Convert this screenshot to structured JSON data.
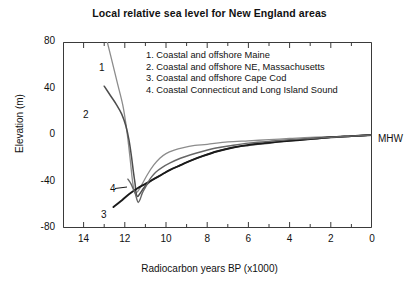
{
  "title": "Local relative sea level for New England areas",
  "axes": {
    "xlabel": "Radiocarbon years BP (x1000)",
    "ylabel": "Elevation (m)",
    "x_ticks": [
      "14",
      "12",
      "10",
      "8",
      "6",
      "4",
      "2",
      "0"
    ],
    "y_ticks": [
      "80",
      "40",
      "0",
      "-40",
      "-80"
    ]
  },
  "annotations": {
    "mhw": "MHW",
    "curve_label_1": "1",
    "curve_label_2": "2",
    "curve_label_3": "3",
    "curve_label_4": "4"
  },
  "legend": {
    "items": [
      "1. Coastal and offshore Maine",
      "2. Coastal and offshore NE, Massachusetts",
      "3. Coastal and offshore Cape Cod",
      "4. Coastal Connecticut and Long Island Sound"
    ]
  },
  "colors": {
    "curve1": "#8c8c8c",
    "curve2": "#4d4d4d",
    "curve3": "#1a1a1a",
    "curve4": "#666666",
    "axis": "#3a3a3a",
    "text": "#111111"
  },
  "chart_data": {
    "type": "line",
    "title": "Local relative sea level for New England areas",
    "xlabel": "Radiocarbon years BP (x1000)",
    "ylabel": "Elevation (m)",
    "xlim": [
      15.0,
      0.0
    ],
    "ylim": [
      -80,
      80
    ],
    "x_reversed": true,
    "grid": false,
    "legend_position": "inside-top-right",
    "x_major_ticks": [
      14,
      12,
      10,
      8,
      6,
      4,
      2,
      0
    ],
    "x_minor_ticks": [
      15,
      13,
      11,
      9,
      7,
      5,
      3,
      1
    ],
    "y_major_ticks": [
      80,
      40,
      0,
      -40,
      -80
    ],
    "y_minor_ticks": [
      70,
      60,
      50,
      30,
      20,
      10,
      -10,
      -20,
      -30,
      -50,
      -60,
      -70
    ],
    "reference_line": {
      "label": "MHW",
      "y": 0
    },
    "series": [
      {
        "name": "1. Coastal and offshore Maine",
        "label": "1",
        "color": "#8c8c8c",
        "points": [
          [
            12.85,
            80
          ],
          [
            12.6,
            62
          ],
          [
            12.35,
            44
          ],
          [
            12.1,
            26
          ],
          [
            11.95,
            10
          ],
          [
            11.82,
            -8
          ],
          [
            11.72,
            -24
          ],
          [
            11.65,
            -36
          ],
          [
            11.58,
            -45
          ],
          [
            11.5,
            -50
          ],
          [
            11.35,
            -48
          ],
          [
            11.15,
            -42
          ],
          [
            10.9,
            -34
          ],
          [
            10.6,
            -26
          ],
          [
            10.3,
            -20
          ],
          [
            10.0,
            -16
          ],
          [
            9.6,
            -13
          ],
          [
            9.2,
            -11
          ],
          [
            8.6,
            -9
          ],
          [
            8.0,
            -8
          ],
          [
            7.0,
            -6
          ],
          [
            6.0,
            -5
          ],
          [
            5.0,
            -4
          ],
          [
            4.0,
            -3
          ],
          [
            3.0,
            -2
          ],
          [
            2.0,
            -1.5
          ],
          [
            1.0,
            -1
          ],
          [
            0.0,
            0
          ]
        ]
      },
      {
        "name": "2. Coastal and offshore NE, Massachusetts",
        "label": "2",
        "color": "#4d4d4d",
        "points": [
          [
            13.0,
            42
          ],
          [
            12.7,
            34
          ],
          [
            12.4,
            26
          ],
          [
            12.15,
            18
          ],
          [
            11.95,
            8
          ],
          [
            11.8,
            -4
          ],
          [
            11.68,
            -18
          ],
          [
            11.58,
            -32
          ],
          [
            11.5,
            -42
          ],
          [
            11.45,
            -50
          ],
          [
            11.38,
            -53
          ],
          [
            11.25,
            -50
          ],
          [
            11.1,
            -46
          ],
          [
            10.9,
            -42
          ],
          [
            10.6,
            -38
          ],
          [
            10.2,
            -34
          ],
          [
            9.8,
            -30
          ],
          [
            9.3,
            -26
          ],
          [
            8.8,
            -22
          ],
          [
            8.2,
            -18
          ],
          [
            7.5,
            -14
          ],
          [
            6.8,
            -11
          ],
          [
            6.0,
            -9
          ],
          [
            5.0,
            -7
          ],
          [
            4.0,
            -5
          ],
          [
            3.0,
            -3.5
          ],
          [
            2.0,
            -2
          ],
          [
            1.0,
            -1
          ],
          [
            0.0,
            0
          ]
        ]
      },
      {
        "name": "3. Coastal and offshore Cape Cod",
        "label": "3",
        "color": "#1a1a1a",
        "points": [
          [
            12.55,
            -62
          ],
          [
            12.2,
            -57
          ],
          [
            11.8,
            -51
          ],
          [
            11.4,
            -46
          ],
          [
            11.0,
            -42
          ],
          [
            10.6,
            -38
          ],
          [
            10.2,
            -34
          ],
          [
            9.8,
            -30
          ],
          [
            9.3,
            -26
          ],
          [
            8.8,
            -22
          ],
          [
            8.2,
            -18
          ],
          [
            7.5,
            -14
          ],
          [
            6.8,
            -11
          ],
          [
            6.0,
            -8.5
          ],
          [
            5.0,
            -6.5
          ],
          [
            4.0,
            -5
          ],
          [
            3.0,
            -3.5
          ],
          [
            2.0,
            -2
          ],
          [
            1.0,
            -1
          ],
          [
            0.0,
            0
          ]
        ]
      },
      {
        "name": "4. Coastal Connecticut and Long Island Sound",
        "label": "4",
        "color": "#666666",
        "points": [
          [
            11.85,
            -38
          ],
          [
            11.7,
            -42
          ],
          [
            11.6,
            -46
          ],
          [
            11.5,
            -50
          ],
          [
            11.42,
            -55
          ],
          [
            11.35,
            -58
          ],
          [
            11.25,
            -55
          ],
          [
            11.15,
            -50
          ],
          [
            11.0,
            -45
          ],
          [
            10.85,
            -40
          ],
          [
            10.7,
            -36
          ],
          [
            10.5,
            -32
          ],
          [
            10.2,
            -28
          ],
          [
            9.8,
            -24
          ],
          [
            9.3,
            -20
          ],
          [
            8.8,
            -17
          ],
          [
            8.2,
            -14
          ],
          [
            7.5,
            -11
          ],
          [
            6.8,
            -9
          ],
          [
            6.0,
            -7
          ],
          [
            5.0,
            -5.5
          ],
          [
            4.0,
            -4
          ],
          [
            3.0,
            -3
          ],
          [
            2.0,
            -2
          ],
          [
            1.0,
            -1
          ],
          [
            0.0,
            0
          ]
        ]
      }
    ]
  }
}
